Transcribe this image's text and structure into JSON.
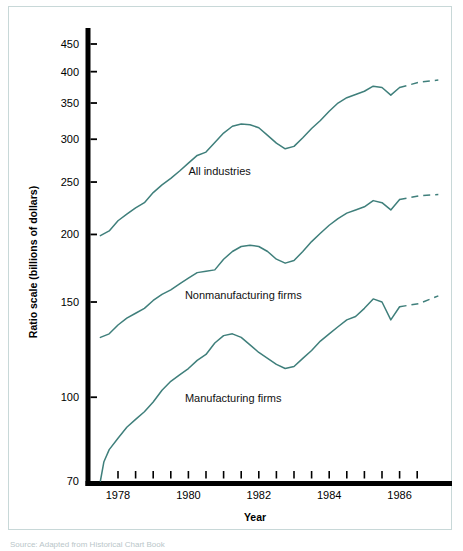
{
  "figure": {
    "background_color": "#ffffff",
    "frame_color": "#c8d8d8",
    "line_color": "#3f7f7b",
    "axis_color": "#000000",
    "source_note": "Source: Adapted from Historical Chart Book"
  },
  "chart_data": {
    "type": "line",
    "title": "",
    "subtitle": "",
    "xlabel": "Year",
    "ylabel": "Ratio scale (billions of dollars)",
    "yscale": "log",
    "ylim": [
      70,
      480
    ],
    "xlim": [
      1977.4,
      1987.3
    ],
    "ytick_labels": [
      "450",
      "400",
      "350",
      "300",
      "250",
      "200",
      "150",
      "100",
      "70"
    ],
    "yticks": [
      450,
      400,
      350,
      300,
      250,
      200,
      150,
      100,
      70
    ],
    "xtick_labels": [
      "1978",
      "1980",
      "1982",
      "1984",
      "1986"
    ],
    "xticks": [
      1978,
      1980,
      1982,
      1984,
      1986
    ],
    "xminor_ticks": [
      1978.5,
      1979,
      1979.5,
      1980.5,
      1981,
      1981.5,
      1982.5,
      1983,
      1983.5,
      1984.5,
      1985,
      1985.5,
      1986.5
    ],
    "grid": false,
    "legend_position": "inline-annotations",
    "annotations": [
      {
        "text": "All industries",
        "x": 1980.0,
        "y": 258
      },
      {
        "text": "Nonmanufacturing firms",
        "x": 1979.9,
        "y": 152
      },
      {
        "text": "Manufacturing firms",
        "x": 1979.9,
        "y": 98
      }
    ],
    "series": [
      {
        "name": "All industries",
        "color": "#3f7f7b",
        "x": [
          1977.5,
          1977.75,
          1978.0,
          1978.25,
          1978.5,
          1978.75,
          1979.0,
          1979.25,
          1979.5,
          1979.75,
          1980.0,
          1980.25,
          1980.5,
          1980.75,
          1981.0,
          1981.25,
          1981.5,
          1981.75,
          1982.0,
          1982.25,
          1982.5,
          1982.75,
          1983.0,
          1983.25,
          1983.5,
          1983.75,
          1984.0,
          1984.25,
          1984.5,
          1984.75,
          1985.0,
          1985.25,
          1985.5,
          1985.75,
          1986.0
        ],
        "values": [
          199,
          203,
          212,
          218,
          224,
          229,
          239,
          247,
          254,
          262,
          271,
          280,
          284,
          296,
          308,
          317,
          320,
          319,
          315,
          305,
          295,
          288,
          291,
          302,
          314,
          325,
          338,
          350,
          358,
          363,
          368,
          376,
          374,
          362,
          374
        ],
        "forecast_x": [
          1986.0,
          1986.6,
          1987.1
        ],
        "forecast_values": [
          374,
          383,
          386
        ]
      },
      {
        "name": "Nonmanufacturing firms",
        "color": "#3f7f7b",
        "x": [
          1977.5,
          1977.75,
          1978.0,
          1978.25,
          1978.5,
          1978.75,
          1979.0,
          1979.25,
          1979.5,
          1979.75,
          1980.0,
          1980.25,
          1980.5,
          1980.75,
          1981.0,
          1981.25,
          1981.5,
          1981.75,
          1982.0,
          1982.25,
          1982.5,
          1982.75,
          1983.0,
          1983.25,
          1983.5,
          1983.75,
          1984.0,
          1984.25,
          1984.5,
          1984.75,
          1985.0,
          1985.25,
          1985.5,
          1985.75,
          1986.0
        ],
        "values": [
          129,
          131,
          136,
          140,
          143,
          146,
          151,
          155,
          158,
          162,
          166,
          170,
          171,
          172,
          180,
          186,
          190,
          191,
          190,
          186,
          180,
          177,
          179,
          186,
          194,
          201,
          208,
          214,
          219,
          222,
          225,
          231,
          229,
          222,
          232
        ],
        "forecast_x": [
          1986.0,
          1986.6,
          1987.1
        ],
        "forecast_values": [
          232,
          236,
          237
        ]
      },
      {
        "name": "Manufacturing firms",
        "color": "#3f7f7b",
        "x": [
          1977.5,
          1977.6,
          1977.75,
          1978.0,
          1978.25,
          1978.5,
          1978.75,
          1979.0,
          1979.25,
          1979.5,
          1979.75,
          1980.0,
          1980.25,
          1980.5,
          1980.75,
          1981.0,
          1981.25,
          1981.5,
          1981.75,
          1982.0,
          1982.25,
          1982.5,
          1982.75,
          1983.0,
          1983.25,
          1983.5,
          1983.75,
          1984.0,
          1984.25,
          1984.5,
          1984.75,
          1985.0,
          1985.25,
          1985.5,
          1985.75,
          1986.0
        ],
        "values": [
          70,
          76,
          80,
          84,
          88,
          91,
          94,
          98,
          103,
          107,
          110,
          113,
          117,
          120,
          126,
          130,
          131,
          129,
          125,
          121,
          118,
          115,
          113,
          114,
          118,
          122,
          127,
          131,
          135,
          139,
          141,
          146,
          152,
          150,
          139,
          147
        ],
        "forecast_x": [
          1986.0,
          1986.55,
          1987.1
        ],
        "forecast_values": [
          147,
          149,
          154
        ]
      }
    ]
  }
}
